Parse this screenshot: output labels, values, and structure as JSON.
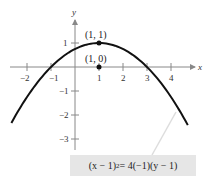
{
  "chart_data": {
    "type": "line",
    "title": "",
    "xlabel": "x",
    "ylabel": "y",
    "xlim": [
      -2.7,
      4.9
    ],
    "ylim": [
      -3.5,
      2.0
    ],
    "grid": false,
    "x_ticks": [
      -2,
      -1,
      1,
      2,
      3,
      4
    ],
    "y_ticks": [
      1,
      -1,
      -2,
      -3
    ],
    "x_tick_labels": [
      "−2",
      "−1",
      "1",
      "2",
      "3",
      "4"
    ],
    "y_tick_labels": [
      "1",
      "−1",
      "−2",
      "−3"
    ],
    "series": [
      {
        "name": "(x − 1)² = 4(−1)(y − 1)",
        "equation": "y = 1 - (x-1)^2/4",
        "x": [
          -2.65,
          -2,
          -1,
          0,
          1,
          2,
          3,
          4,
          4.7
        ],
        "y": [
          -2.33,
          -1.25,
          0,
          0.75,
          1,
          0.75,
          0,
          -1.25,
          -2.42
        ]
      }
    ],
    "points": [
      {
        "label": "(1, 1)",
        "x": 1,
        "y": 1,
        "role": "vertex"
      },
      {
        "label": "(1, 0)",
        "x": 1,
        "y": 0,
        "role": "focus"
      }
    ],
    "annotation": {
      "text_parts": {
        "lhs_base": "(x − 1)",
        "lhs_exp": "2",
        "rhs": " = 4(−1)(y − 1)"
      }
    }
  },
  "labels": {
    "x_axis": "x",
    "y_axis": "y",
    "vertex": "(1, 1)",
    "focus": "(1, 0)",
    "ticks": {
      "xm2": "−2",
      "xm1": "−1",
      "x1": "1",
      "x2": "2",
      "x3": "3",
      "x4": "4",
      "y1": "1",
      "ym1": "−1",
      "ym2": "−2",
      "ym3": "−3"
    },
    "equation": {
      "lhs_base": "(x − 1)",
      "lhs_exp": "2",
      "rhs": " = 4(−1)(y − 1)"
    }
  },
  "colors": {
    "curve": "#111111",
    "axis": "#888888",
    "box": "#e6e6e6",
    "leader": "#dddddd"
  }
}
